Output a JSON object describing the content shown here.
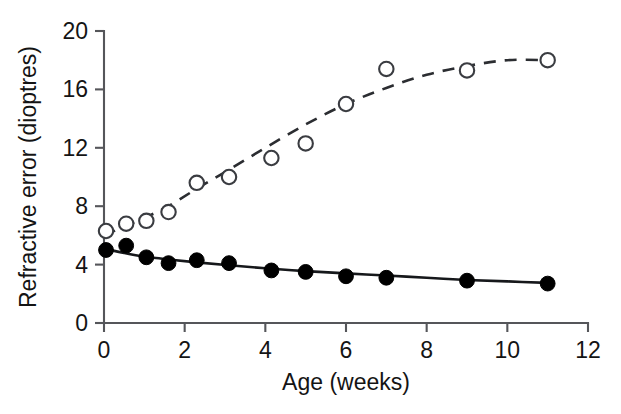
{
  "chart_data": {
    "type": "scatter",
    "title": "",
    "subtitle": "",
    "xlabel": "Age (weeks)",
    "ylabel": "Refractive error (dioptres)",
    "xlim": [
      0,
      12
    ],
    "ylim": [
      0,
      20
    ],
    "xticks": [
      "0",
      "2",
      "4",
      "6",
      "8",
      "10",
      "12"
    ],
    "yticks": [
      "0",
      "4",
      "8",
      "12",
      "16",
      "20"
    ],
    "xtick_values": [
      0,
      2,
      4,
      6,
      8,
      10,
      12
    ],
    "ytick_values": [
      0,
      4,
      8,
      12,
      16,
      20
    ],
    "grid": false,
    "legend": "none",
    "series": [
      {
        "name": "open-circles-dashed",
        "marker": "open circle",
        "line_style": "dashed",
        "color": "#2b2d31",
        "x": [
          0.05,
          0.55,
          1.05,
          1.6,
          2.3,
          3.1,
          4.15,
          5.0,
          6.0,
          7.0,
          9.0,
          11.0
        ],
        "y": [
          6.3,
          6.8,
          7.0,
          7.6,
          9.6,
          10.0,
          11.3,
          12.3,
          15.0,
          17.4,
          17.3,
          18.0
        ]
      },
      {
        "name": "filled-circles-solid",
        "marker": "filled circle",
        "line_style": "solid",
        "color": "#000000",
        "x": [
          0.05,
          0.55,
          1.05,
          1.6,
          2.3,
          3.1,
          4.15,
          5.0,
          6.0,
          7.0,
          9.0,
          11.0
        ],
        "y": [
          5.0,
          5.3,
          4.5,
          4.1,
          4.3,
          4.1,
          3.6,
          3.5,
          3.2,
          3.1,
          2.9,
          2.7
        ]
      }
    ],
    "fit_curves": [
      {
        "name": "dashed-fit",
        "style": "dashed",
        "points_x": [
          0.0,
          0.5,
          1.0,
          1.6,
          2.3,
          3.1,
          4.0,
          5.0,
          6.0,
          7.0,
          8.0,
          9.0,
          10.0,
          11.0
        ],
        "points_y": [
          6.0,
          6.6,
          7.2,
          8.0,
          9.2,
          10.5,
          12.0,
          13.6,
          15.0,
          16.1,
          17.0,
          17.6,
          18.0,
          18.0
        ]
      },
      {
        "name": "solid-fit",
        "style": "solid",
        "points_x": [
          0.0,
          0.5,
          1.0,
          1.6,
          2.3,
          3.1,
          4.0,
          5.0,
          6.0,
          7.0,
          8.0,
          9.0,
          10.0,
          11.0
        ],
        "points_y": [
          5.1,
          4.8,
          4.55,
          4.35,
          4.15,
          3.95,
          3.75,
          3.55,
          3.4,
          3.25,
          3.1,
          2.95,
          2.85,
          2.75
        ]
      }
    ]
  },
  "axes": {
    "x_title": "Age (weeks)",
    "y_title": "Refractive error (dioptres)"
  }
}
